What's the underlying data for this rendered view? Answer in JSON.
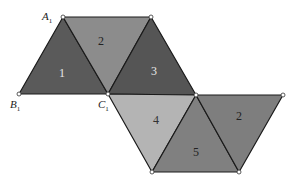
{
  "diagram": {
    "faces": [
      {
        "id": "face-1",
        "label": "1",
        "fill": "#5a5a5a",
        "text_color": "#e8e8e8"
      },
      {
        "id": "face-2-top",
        "label": "2",
        "fill": "#8c8c8c",
        "text_color": "#222222"
      },
      {
        "id": "face-3",
        "label": "3",
        "fill": "#555555",
        "text_color": "#e8e8e8"
      },
      {
        "id": "face-4",
        "label": "4",
        "fill": "#b4b4b4",
        "text_color": "#333333"
      },
      {
        "id": "face-5",
        "label": "5",
        "fill": "#808080",
        "text_color": "#222222"
      },
      {
        "id": "face-2-right",
        "label": "2",
        "fill": "#7e7e7e",
        "text_color": "#222222"
      }
    ],
    "vertex_labels": {
      "A": {
        "letter": "A",
        "sub": "1"
      },
      "B": {
        "letter": "B",
        "sub": "1"
      },
      "C": {
        "letter": "C",
        "sub": "1"
      }
    }
  }
}
